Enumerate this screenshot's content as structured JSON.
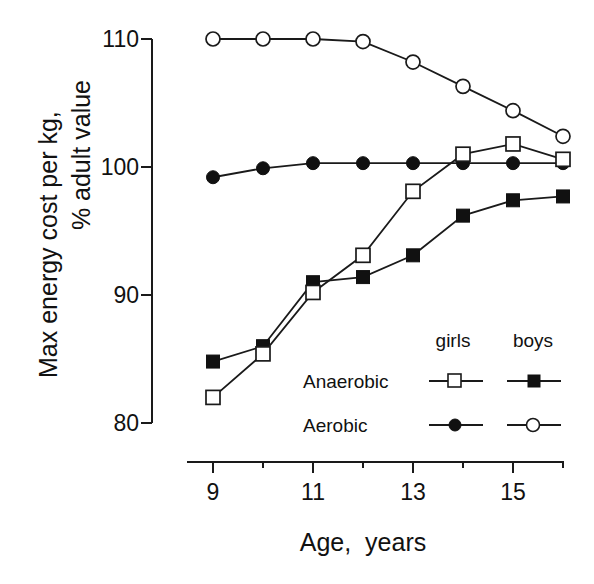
{
  "chart_data": {
    "type": "line",
    "title": "",
    "xlabel": "Age,  years",
    "ylabel_lines": [
      "Max energy cost per kg,",
      "% adult value"
    ],
    "ylabel": "Max energy cost per kg, % adult value",
    "x": [
      9,
      10,
      11,
      12,
      13,
      14,
      15,
      16
    ],
    "xlim": [
      8.5,
      16
    ],
    "ylim": [
      80,
      110
    ],
    "x_ticks_major": [
      9,
      11,
      13,
      15
    ],
    "x_ticks_minor": [
      10,
      12,
      14,
      16
    ],
    "y_ticks": [
      80,
      90,
      100,
      110
    ],
    "grid": false,
    "legend_position": "lower right (inside)",
    "legend": {
      "column_headers": [
        "girls",
        "boys"
      ],
      "row_labels": [
        "Anaerobic",
        "Aerobic"
      ]
    },
    "series": [
      {
        "name": "Anaerobic, girls",
        "marker": "open-square",
        "values": [
          82.0,
          85.4,
          90.2,
          93.1,
          98.1,
          101.0,
          101.8,
          100.6
        ]
      },
      {
        "name": "Anaerobic, boys",
        "marker": "filled-square",
        "values": [
          84.8,
          86.0,
          91.0,
          91.4,
          93.1,
          96.2,
          97.4,
          97.7
        ]
      },
      {
        "name": "Aerobic, girls",
        "marker": "filled-circle",
        "values": [
          99.2,
          99.9,
          100.3,
          100.3,
          100.3,
          100.3,
          100.3,
          100.3
        ]
      },
      {
        "name": "Aerobic, boys",
        "marker": "open-circle",
        "values": [
          110.0,
          110.0,
          110.0,
          109.8,
          108.2,
          106.3,
          104.4,
          102.4
        ]
      }
    ]
  },
  "axes": {
    "y_tick_labels": [
      "110",
      "100",
      "90",
      "80"
    ],
    "x_tick_labels": [
      "9",
      "11",
      "13",
      "15"
    ]
  }
}
